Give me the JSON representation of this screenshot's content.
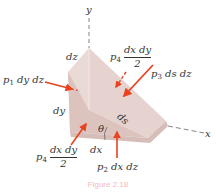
{
  "figure": {
    "axes": {
      "x_label": "x",
      "y_label": "y"
    },
    "dimensions": {
      "dz": "dz",
      "dy": "dy",
      "dx": "dx",
      "ds": "ds",
      "angle": "θ"
    },
    "forces": {
      "p1": {
        "symbol": "p",
        "sub": "1",
        "rest": " dy dz"
      },
      "p2": {
        "symbol": "p",
        "sub": "2",
        "rest": " dx dz"
      },
      "p3": {
        "symbol": "p",
        "sub": "3",
        "rest": " ds dz"
      },
      "p4_front": {
        "symbol": "p",
        "sub": "4",
        "num": "dx dy",
        "den": "2"
      },
      "p4_back": {
        "symbol": "p",
        "sub": "4",
        "num": "dx dy",
        "den": "2"
      }
    },
    "caption": "Figure 2.18",
    "colors": {
      "arrow": "#e8421f",
      "wedge_light": "#eeddd9",
      "wedge_mid": "#e2c9c4",
      "wedge_dark": "#cfb2ac",
      "axis": "#555555"
    }
  }
}
